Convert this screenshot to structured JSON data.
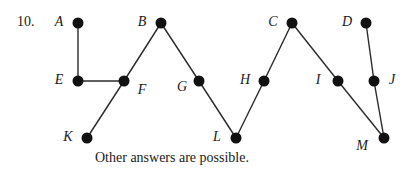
{
  "problem_number": "10.",
  "caption": "Other answers are possible.",
  "colors": {
    "node": "#111111",
    "edge": "#2a2a2a",
    "text": "#1a1a1a",
    "background": "#ffffff"
  },
  "graph": {
    "type": "tree",
    "nodes": [
      {
        "id": "A",
        "label": "A",
        "x": 78,
        "y": 23,
        "label_x": 59,
        "label_y": 22
      },
      {
        "id": "B",
        "label": "B",
        "x": 161,
        "y": 23,
        "label_x": 142,
        "label_y": 22
      },
      {
        "id": "C",
        "label": "C",
        "x": 292,
        "y": 23,
        "label_x": 273,
        "label_y": 22
      },
      {
        "id": "D",
        "label": "D",
        "x": 366,
        "y": 23,
        "label_x": 347,
        "label_y": 22
      },
      {
        "id": "E",
        "label": "E",
        "x": 78,
        "y": 81,
        "label_x": 59,
        "label_y": 80
      },
      {
        "id": "F",
        "label": "F",
        "x": 124,
        "y": 81,
        "label_x": 142,
        "label_y": 90
      },
      {
        "id": "G",
        "label": "G",
        "x": 199,
        "y": 81,
        "label_x": 182,
        "label_y": 87
      },
      {
        "id": "H",
        "label": "H",
        "x": 264,
        "y": 81,
        "label_x": 245,
        "label_y": 80
      },
      {
        "id": "I",
        "label": "I",
        "x": 338,
        "y": 81,
        "label_x": 318,
        "label_y": 80
      },
      {
        "id": "J",
        "label": "J",
        "x": 374,
        "y": 81,
        "label_x": 392,
        "label_y": 80
      },
      {
        "id": "K",
        "label": "K",
        "x": 87,
        "y": 138,
        "label_x": 68,
        "label_y": 137
      },
      {
        "id": "L",
        "label": "L",
        "x": 236,
        "y": 138,
        "label_x": 217,
        "label_y": 137
      },
      {
        "id": "M",
        "label": "M",
        "x": 384,
        "y": 138,
        "label_x": 362,
        "label_y": 146
      }
    ],
    "edges": [
      [
        "A",
        "E"
      ],
      [
        "E",
        "F"
      ],
      [
        "F",
        "B"
      ],
      [
        "F",
        "K"
      ],
      [
        "B",
        "G"
      ],
      [
        "G",
        "L"
      ],
      [
        "L",
        "H"
      ],
      [
        "H",
        "C"
      ],
      [
        "C",
        "I"
      ],
      [
        "I",
        "M"
      ],
      [
        "D",
        "J"
      ],
      [
        "J",
        "M"
      ]
    ]
  }
}
